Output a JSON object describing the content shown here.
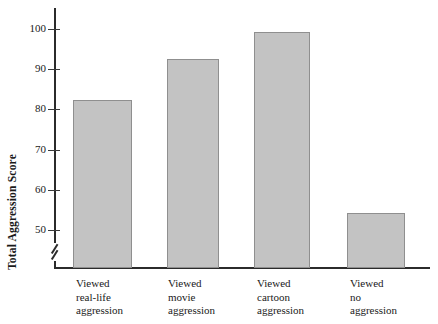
{
  "chart_data": {
    "type": "bar",
    "title": "",
    "xlabel": "",
    "ylabel": "Total Aggression Score",
    "categories": [
      "Viewed\nreal-life\naggression",
      "Viewed\nmovie\naggression",
      "Viewed\ncartoon\naggression",
      "Viewed\nno\naggression"
    ],
    "values": [
      82.3,
      92.5,
      99.3,
      54.2
    ],
    "ytick_labels": [
      "50",
      "60",
      "70",
      "80",
      "90",
      "100"
    ],
    "ytick_values": [
      50,
      60,
      70,
      80,
      90,
      100
    ],
    "ylim": [
      50,
      104
    ],
    "axis_break": true,
    "grid": false,
    "legend": null,
    "bar_fill_color": "#c3c3c3",
    "bar_border_color": "#8f8f8f",
    "axis_color": "#2b2b2b"
  },
  "axis": {
    "y_title": "Total Aggression Score"
  }
}
